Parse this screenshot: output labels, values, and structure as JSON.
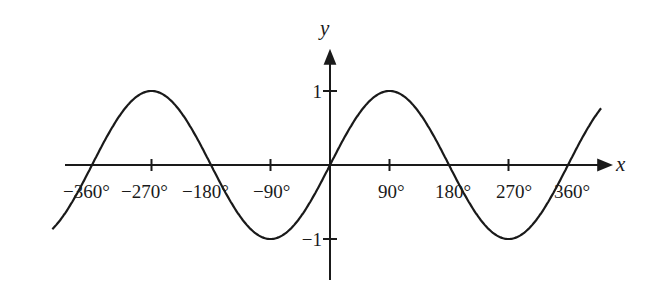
{
  "chart_data": {
    "type": "line",
    "title": "",
    "function": "y = sin x",
    "xlabel": "x",
    "ylabel": "y",
    "x_unit": "degrees",
    "xlim": [
      -420,
      410
    ],
    "ylim": [
      -1.6,
      1.6
    ],
    "grid": false,
    "legend": null,
    "x_ticks": [
      -270,
      -90,
      90,
      270
    ],
    "x_tick_labels": [
      {
        "text": "−360°",
        "value": -360
      },
      {
        "text": "−270°",
        "value": -270
      },
      {
        "text": "−180°",
        "value": -180
      },
      {
        "text": "−90°",
        "value": -90
      },
      {
        "text": "90°",
        "value": 90
      },
      {
        "text": "180°",
        "value": 180
      },
      {
        "text": "270°",
        "value": 270
      },
      {
        "text": "360°",
        "value": 360
      }
    ],
    "y_ticks": [
      1,
      -1
    ],
    "y_tick_labels": [
      "1",
      "−1"
    ],
    "series": [
      {
        "name": "sin x",
        "x": [
          -420,
          -360,
          -270,
          -180,
          -90,
          0,
          90,
          180,
          270,
          360,
          410
        ],
        "values": [
          -0.87,
          0,
          1,
          0,
          -1,
          0,
          1,
          0,
          -1,
          0,
          0.98
        ]
      }
    ]
  },
  "axes": {
    "x_name": "x",
    "y_name": "y"
  },
  "colors": {
    "ink": "#1a1a1a",
    "background": "#ffffff"
  }
}
